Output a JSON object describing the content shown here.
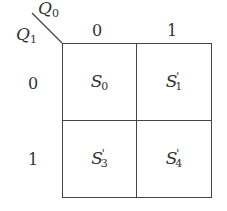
{
  "diagram": {
    "type": "karnaugh-map",
    "column_variable": {
      "name": "Q",
      "sub": "0"
    },
    "row_variable": {
      "name": "Q",
      "sub": "1"
    },
    "column_headers": [
      "0",
      "1"
    ],
    "row_headers": [
      "0",
      "1"
    ],
    "cells": [
      [
        {
          "name": "S",
          "sub": "0",
          "prime": ""
        },
        {
          "name": "S",
          "sub": "1",
          "prime": "'"
        }
      ],
      [
        {
          "name": "S",
          "sub": "3",
          "prime": "'"
        },
        {
          "name": "S",
          "sub": "4",
          "prime": "'"
        }
      ]
    ]
  }
}
